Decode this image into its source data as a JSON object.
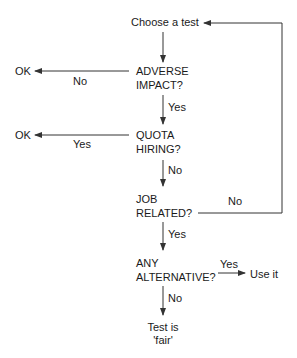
{
  "diagram": {
    "type": "flowchart",
    "nodes": {
      "start": "Choose a test",
      "adverse_1": "ADVERSE",
      "adverse_2": "IMPACT?",
      "quota_1": "QUOTA",
      "quota_2": "HIRING?",
      "job_1": "JOB",
      "job_2": "RELATED?",
      "alt_1": "ANY",
      "alt_2": "ALTERNATIVE?",
      "ok_1": "OK",
      "ok_2": "OK",
      "use_it": "Use it",
      "fair_1": "Test is",
      "fair_2": "'fair'"
    },
    "edge_labels": {
      "adverse_no": "No",
      "adverse_yes": "Yes",
      "quota_yes": "Yes",
      "quota_no": "No",
      "job_no": "No",
      "job_yes": "Yes",
      "alt_yes": "Yes",
      "alt_no": "No"
    },
    "colors": {
      "line": "#333333",
      "text": "#1a1a1a",
      "background": "#ffffff"
    }
  }
}
